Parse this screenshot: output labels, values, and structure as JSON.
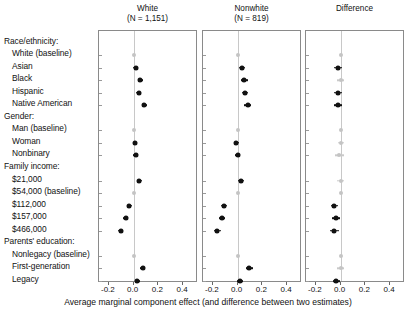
{
  "figure": {
    "xlabel": "Average marginal component effect (and difference between two estimates)",
    "tick_labels": [
      "-0.2",
      "0.0",
      "0.2",
      "0.4"
    ],
    "tick_values": [
      -0.2,
      0.0,
      0.2,
      0.4
    ],
    "xlim": [
      -0.28,
      0.52
    ],
    "accent_color": "#111111",
    "baseline_color": "#c4c4c4",
    "panel_border_color": "#8a8a8a"
  },
  "rows": [
    {
      "label": "Race/ethnicity:",
      "type": "group"
    },
    {
      "label": "White (baseline)",
      "type": "level"
    },
    {
      "label": "Asian",
      "type": "level"
    },
    {
      "label": "Black",
      "type": "level"
    },
    {
      "label": "Hispanic",
      "type": "level"
    },
    {
      "label": "Native American",
      "type": "level"
    },
    {
      "label": "Gender:",
      "type": "group"
    },
    {
      "label": "Man (baseline)",
      "type": "level"
    },
    {
      "label": "Woman",
      "type": "level"
    },
    {
      "label": "Nonbinary",
      "type": "level"
    },
    {
      "label": "Family income:",
      "type": "group"
    },
    {
      "label": "$21,000",
      "type": "level"
    },
    {
      "label": "$54,000 (baseline)",
      "type": "level"
    },
    {
      "label": "$112,000",
      "type": "level"
    },
    {
      "label": "$157,000",
      "type": "level"
    },
    {
      "label": "$466,000",
      "type": "level"
    },
    {
      "label": "Parents' education:",
      "type": "group"
    },
    {
      "label": "Nonlegacy (baseline)",
      "type": "level"
    },
    {
      "label": "First-generation",
      "type": "level"
    },
    {
      "label": "Legacy",
      "type": "level"
    }
  ],
  "chart_data": {
    "type": "scatter",
    "title": "",
    "xlabel": "Average marginal component effect (and difference between two estimates)",
    "ylabel": "",
    "xlim": [
      -0.28,
      0.52
    ],
    "xticks": [
      -0.2,
      0.0,
      0.2,
      0.4
    ],
    "grid": false,
    "legend": "none",
    "zero_reference_line": 0.0,
    "categories": [
      "White (baseline)",
      "Asian",
      "Black",
      "Hispanic",
      "Native American",
      "Man (baseline)",
      "Woman",
      "Nonbinary",
      "$21,000",
      "$54,000 (baseline)",
      "$112,000",
      "$157,000",
      "$466,000",
      "Nonlegacy (baseline)",
      "First-generation",
      "Legacy"
    ],
    "panels": [
      {
        "name": "White",
        "title_line1": "White",
        "title_line2": "(N = 1,151)",
        "n": 1151,
        "points": [
          {
            "category": "White (baseline)",
            "estimate": 0.0,
            "lo": 0.0,
            "hi": 0.0,
            "baseline": true
          },
          {
            "category": "Asian",
            "estimate": 0.015,
            "lo": -0.005,
            "hi": 0.035,
            "baseline": false
          },
          {
            "category": "Black",
            "estimate": 0.055,
            "lo": 0.035,
            "hi": 0.075,
            "baseline": false
          },
          {
            "category": "Hispanic",
            "estimate": 0.04,
            "lo": 0.02,
            "hi": 0.06,
            "baseline": false
          },
          {
            "category": "Native American",
            "estimate": 0.085,
            "lo": 0.065,
            "hi": 0.105,
            "baseline": false
          },
          {
            "category": "Man (baseline)",
            "estimate": 0.0,
            "lo": 0.0,
            "hi": 0.0,
            "baseline": true
          },
          {
            "category": "Woman",
            "estimate": 0.01,
            "lo": -0.005,
            "hi": 0.025,
            "baseline": false
          },
          {
            "category": "Nonbinary",
            "estimate": 0.015,
            "lo": -0.002,
            "hi": 0.032,
            "baseline": false
          },
          {
            "category": "$21,000",
            "estimate": 0.045,
            "lo": 0.025,
            "hi": 0.065,
            "baseline": false
          },
          {
            "category": "$54,000 (baseline)",
            "estimate": 0.0,
            "lo": 0.0,
            "hi": 0.0,
            "baseline": true
          },
          {
            "category": "$112,000",
            "estimate": -0.035,
            "lo": -0.055,
            "hi": -0.015,
            "baseline": false
          },
          {
            "category": "$157,000",
            "estimate": -0.065,
            "lo": -0.085,
            "hi": -0.045,
            "baseline": false
          },
          {
            "category": "$466,000",
            "estimate": -0.105,
            "lo": -0.128,
            "hi": -0.082,
            "baseline": false
          },
          {
            "category": "Nonlegacy (baseline)",
            "estimate": 0.0,
            "lo": 0.0,
            "hi": 0.0,
            "baseline": true
          },
          {
            "category": "First-generation",
            "estimate": 0.075,
            "lo": 0.055,
            "hi": 0.095,
            "baseline": false
          },
          {
            "category": "Legacy",
            "estimate": 0.03,
            "lo": 0.01,
            "hi": 0.05,
            "baseline": false
          }
        ]
      },
      {
        "name": "Nonwhite",
        "title_line1": "Nonwhite",
        "title_line2": "(N = 819)",
        "n": 819,
        "points": [
          {
            "category": "White (baseline)",
            "estimate": 0.0,
            "lo": 0.0,
            "hi": 0.0,
            "baseline": true
          },
          {
            "category": "Asian",
            "estimate": 0.035,
            "lo": 0.008,
            "hi": 0.062,
            "baseline": false
          },
          {
            "category": "Black",
            "estimate": 0.055,
            "lo": 0.028,
            "hi": 0.082,
            "baseline": false
          },
          {
            "category": "Hispanic",
            "estimate": 0.06,
            "lo": 0.033,
            "hi": 0.087,
            "baseline": false
          },
          {
            "category": "Native American",
            "estimate": 0.08,
            "lo": 0.052,
            "hi": 0.108,
            "baseline": false
          },
          {
            "category": "Man (baseline)",
            "estimate": 0.0,
            "lo": 0.0,
            "hi": 0.0,
            "baseline": true
          },
          {
            "category": "Woman",
            "estimate": -0.01,
            "lo": -0.032,
            "hi": 0.012,
            "baseline": false
          },
          {
            "category": "Nonbinary",
            "estimate": 0.0,
            "lo": -0.022,
            "hi": 0.022,
            "baseline": false
          },
          {
            "category": "$21,000",
            "estimate": 0.025,
            "lo": 0.0,
            "hi": 0.05,
            "baseline": false
          },
          {
            "category": "$54,000 (baseline)",
            "estimate": 0.0,
            "lo": 0.0,
            "hi": 0.0,
            "baseline": true
          },
          {
            "category": "$112,000",
            "estimate": -0.11,
            "lo": -0.135,
            "hi": -0.085,
            "baseline": false
          },
          {
            "category": "$157,000",
            "estimate": -0.125,
            "lo": -0.15,
            "hi": -0.1,
            "baseline": false
          },
          {
            "category": "$466,000",
            "estimate": -0.165,
            "lo": -0.192,
            "hi": -0.138,
            "baseline": false
          },
          {
            "category": "Nonlegacy (baseline)",
            "estimate": 0.0,
            "lo": 0.0,
            "hi": 0.0,
            "baseline": true
          },
          {
            "category": "First-generation",
            "estimate": 0.095,
            "lo": 0.07,
            "hi": 0.12,
            "baseline": false
          },
          {
            "category": "Legacy",
            "estimate": 0.02,
            "lo": -0.005,
            "hi": 0.045,
            "baseline": false
          }
        ]
      },
      {
        "name": "Difference",
        "title_line1": "Difference",
        "title_line2": "",
        "n": null,
        "points": [
          {
            "category": "White (baseline)",
            "estimate": 0.0,
            "lo": 0.0,
            "hi": 0.0,
            "baseline": true
          },
          {
            "category": "Asian",
            "estimate": -0.02,
            "lo": -0.05,
            "hi": 0.01,
            "baseline": false
          },
          {
            "category": "Black",
            "estimate": 0.0,
            "lo": -0.03,
            "hi": 0.03,
            "baseline": true
          },
          {
            "category": "Hispanic",
            "estimate": -0.02,
            "lo": -0.05,
            "hi": 0.01,
            "baseline": false
          },
          {
            "category": "Native American",
            "estimate": -0.02,
            "lo": -0.05,
            "hi": 0.01,
            "baseline": false
          },
          {
            "category": "Man (baseline)",
            "estimate": 0.0,
            "lo": 0.0,
            "hi": 0.0,
            "baseline": true
          },
          {
            "category": "Woman",
            "estimate": 0.0,
            "lo": -0.025,
            "hi": 0.025,
            "baseline": true
          },
          {
            "category": "Nonbinary",
            "estimate": -0.01,
            "lo": -0.045,
            "hi": 0.025,
            "baseline": true
          },
          {
            "category": "$21,000",
            "estimate": 0.0,
            "lo": -0.03,
            "hi": 0.03,
            "baseline": true
          },
          {
            "category": "$54,000 (baseline)",
            "estimate": 0.0,
            "lo": 0.0,
            "hi": 0.0,
            "baseline": true
          },
          {
            "category": "$112,000",
            "estimate": -0.05,
            "lo": -0.082,
            "hi": -0.018,
            "baseline": false
          },
          {
            "category": "$157,000",
            "estimate": -0.035,
            "lo": -0.068,
            "hi": -0.002,
            "baseline": false
          },
          {
            "category": "$466,000",
            "estimate": -0.05,
            "lo": -0.085,
            "hi": -0.015,
            "baseline": false
          },
          {
            "category": "Nonlegacy (baseline)",
            "estimate": 0.0,
            "lo": 0.0,
            "hi": 0.0,
            "baseline": true
          },
          {
            "category": "First-generation",
            "estimate": 0.0,
            "lo": -0.03,
            "hi": 0.03,
            "baseline": true
          },
          {
            "category": "Legacy",
            "estimate": -0.035,
            "lo": -0.065,
            "hi": -0.005,
            "baseline": false
          }
        ]
      }
    ]
  }
}
